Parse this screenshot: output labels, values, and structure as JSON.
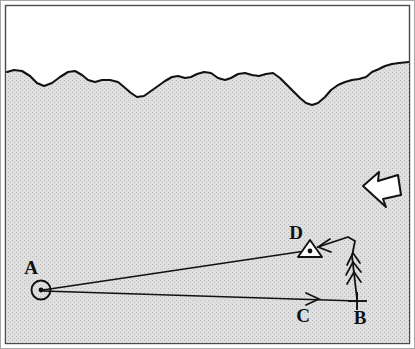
{
  "figure": {
    "kind": "survey-diagram",
    "width": 415,
    "height": 349,
    "background_color": "#ffffff",
    "terrain_fill_color": "#dcdcdc",
    "stipple_dot_color": "#b9b9b9",
    "line_color": "#111111",
    "frame_color": "#888888",
    "frame_inner_color": "#303030"
  },
  "points": [
    {
      "id": "A",
      "label": "A",
      "marker": "circle-with-center-dot",
      "x": 41,
      "y": 290,
      "label_x": 31,
      "label_y": 274
    },
    {
      "id": "B",
      "label": "B",
      "marker": "cross-tick",
      "x": 358,
      "y": 301,
      "label_x": 355,
      "label_y": 324
    },
    {
      "id": "C",
      "label": "C",
      "marker": "arrowhead-on-line",
      "x": 313,
      "y": 299,
      "label_x": 299,
      "label_y": 322
    },
    {
      "id": "D",
      "label": "D",
      "marker": "triangle-with-center-dot",
      "x": 310,
      "y": 249,
      "label_x": 294,
      "label_y": 240
    }
  ],
  "sight_lines": [
    {
      "name": "A-to-D",
      "from": "A",
      "to": "D"
    },
    {
      "name": "A-to-B",
      "from": "A",
      "to": "B",
      "arrowhead_at": "C"
    }
  ],
  "flow_path": {
    "name": "B-to-D-path",
    "description": "vertical chevron path rising from B then bending left to D",
    "chevron_count": 3
  },
  "direction_arrow": {
    "name": "direction-arrow",
    "points_toward": "left",
    "fill": "#ffffff",
    "stroke": "#111111",
    "x": 356,
    "y": 166,
    "width": 44,
    "height": 44
  },
  "terrain_boundary": {
    "name": "shoreline-profile",
    "description": "irregular wavy boundary separating upper white region from lower stippled region"
  }
}
